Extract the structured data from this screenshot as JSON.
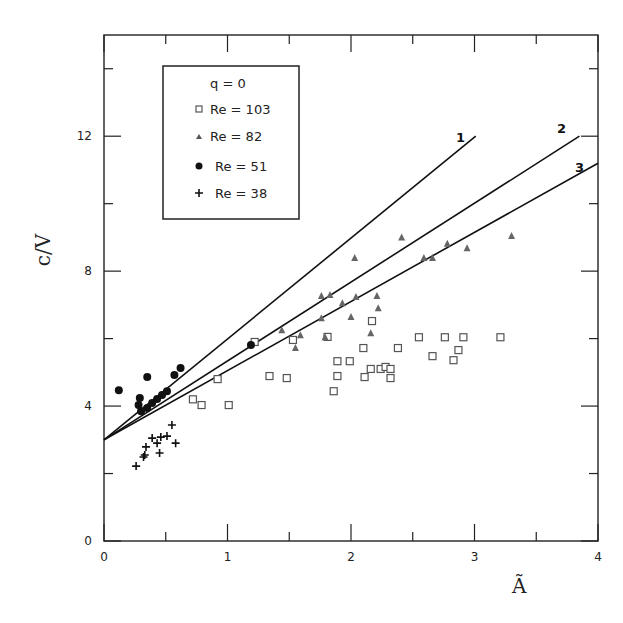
{
  "chart_data": {
    "type": "scatter",
    "title": "",
    "xlabel": "Ã",
    "ylabel": "c/V",
    "xlim": [
      0,
      4
    ],
    "ylim": [
      0,
      15
    ],
    "x_ticks": [
      0,
      1,
      2,
      3,
      4
    ],
    "y_ticks": [
      0,
      4,
      8,
      12
    ],
    "x_minor_ticks": [
      0.5,
      1.5,
      2.5,
      3.5
    ],
    "y_minor_ticks": [
      2,
      6,
      10,
      14
    ],
    "grid": false,
    "legend": {
      "position": "upper-left",
      "title": "q = 0",
      "entries": [
        {
          "marker": "square",
          "label": "Re = 103"
        },
        {
          "marker": "triangle",
          "label": "Re = 82"
        },
        {
          "marker": "circle",
          "label": "Re = 51"
        },
        {
          "marker": "plus",
          "label": "Re = 38"
        }
      ]
    },
    "lines": [
      {
        "name": "1",
        "x": [
          0,
          3.01
        ],
        "y": [
          3.0,
          12.0
        ]
      },
      {
        "name": "2",
        "x": [
          0,
          3.85
        ],
        "y": [
          3.0,
          12.0
        ]
      },
      {
        "name": "3",
        "x": [
          0,
          4.0
        ],
        "y": [
          3.0,
          11.2
        ]
      }
    ],
    "series": [
      {
        "name": "Re = 103",
        "marker": "square",
        "points": [
          [
            0.72,
            4.2
          ],
          [
            0.79,
            4.03
          ],
          [
            0.92,
            4.8
          ],
          [
            1.01,
            4.03
          ],
          [
            1.22,
            5.9
          ],
          [
            1.34,
            4.89
          ],
          [
            1.48,
            4.83
          ],
          [
            1.53,
            5.96
          ],
          [
            1.81,
            6.05
          ],
          [
            1.86,
            4.44
          ],
          [
            1.89,
            5.33
          ],
          [
            1.89,
            4.89
          ],
          [
            1.99,
            5.33
          ],
          [
            2.1,
            5.72
          ],
          [
            2.11,
            4.86
          ],
          [
            2.16,
            5.1
          ],
          [
            2.17,
            6.52
          ],
          [
            2.24,
            5.1
          ],
          [
            2.28,
            5.16
          ],
          [
            2.32,
            4.83
          ],
          [
            2.32,
            5.1
          ],
          [
            2.38,
            5.72
          ],
          [
            2.55,
            6.04
          ],
          [
            2.66,
            5.48
          ],
          [
            2.76,
            6.04
          ],
          [
            2.83,
            5.36
          ],
          [
            2.87,
            5.66
          ],
          [
            2.91,
            6.04
          ],
          [
            3.21,
            6.04
          ]
        ]
      },
      {
        "name": "Re = 82",
        "marker": "triangle",
        "points": [
          [
            1.44,
            6.25
          ],
          [
            1.55,
            5.72
          ],
          [
            1.59,
            6.1
          ],
          [
            1.76,
            7.26
          ],
          [
            1.76,
            6.6
          ],
          [
            1.79,
            6.04
          ],
          [
            1.83,
            7.29
          ],
          [
            1.93,
            7.05
          ],
          [
            2.0,
            6.64
          ],
          [
            2.03,
            8.39
          ],
          [
            2.04,
            7.23
          ],
          [
            2.16,
            6.16
          ],
          [
            2.21,
            7.26
          ],
          [
            2.22,
            6.9
          ],
          [
            2.41,
            9.0
          ],
          [
            2.59,
            8.39
          ],
          [
            2.66,
            8.39
          ],
          [
            2.78,
            8.81
          ],
          [
            2.94,
            8.68
          ],
          [
            3.3,
            9.04
          ]
        ]
      },
      {
        "name": "Re = 51",
        "marker": "circle",
        "points": [
          [
            0.12,
            4.47
          ],
          [
            0.28,
            4.03
          ],
          [
            0.29,
            4.24
          ],
          [
            0.3,
            3.85
          ],
          [
            0.35,
            4.86
          ],
          [
            0.35,
            3.94
          ],
          [
            0.39,
            4.09
          ],
          [
            0.43,
            4.21
          ],
          [
            0.47,
            4.33
          ],
          [
            0.51,
            4.44
          ],
          [
            0.57,
            4.92
          ],
          [
            0.62,
            5.13
          ],
          [
            1.19,
            5.81
          ]
        ]
      },
      {
        "name": "Re = 38",
        "marker": "plus",
        "points": [
          [
            0.26,
            2.22
          ],
          [
            0.32,
            2.49
          ],
          [
            0.33,
            2.55
          ],
          [
            0.34,
            2.79
          ],
          [
            0.39,
            3.05
          ],
          [
            0.43,
            2.9
          ],
          [
            0.45,
            2.61
          ],
          [
            0.46,
            3.08
          ],
          [
            0.51,
            3.11
          ],
          [
            0.55,
            3.44
          ],
          [
            0.58,
            2.9
          ]
        ]
      }
    ]
  },
  "labels": {
    "x_axis_title": "Ã",
    "y_axis_title": "c/V",
    "legend_title": "q = 0",
    "legend_entries": [
      "Re = 103",
      "Re = 82",
      "Re = 51",
      "Re = 38"
    ],
    "line_labels": [
      "1",
      "2",
      "3"
    ]
  }
}
